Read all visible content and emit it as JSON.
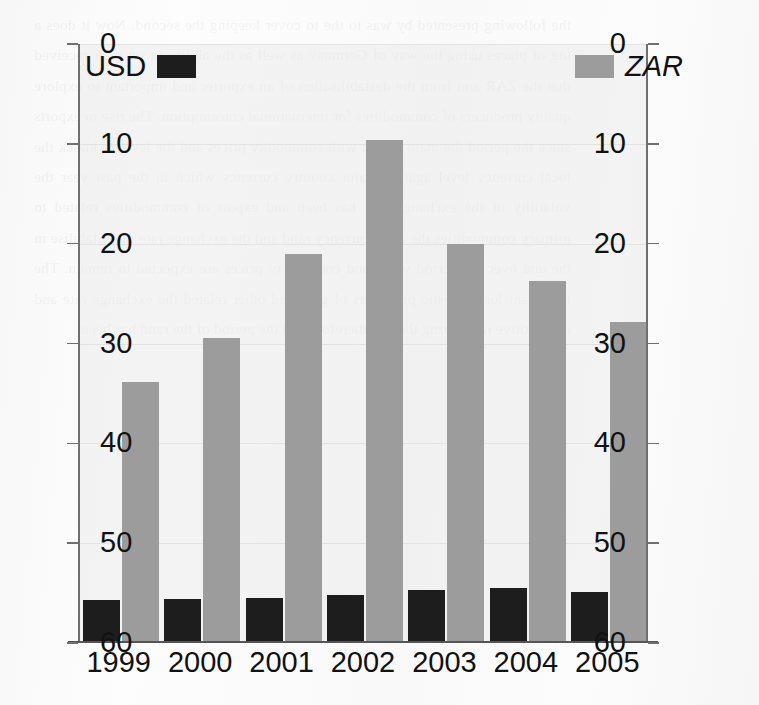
{
  "figure": {
    "width": 759,
    "height": 705,
    "background_color": "#fbfbfb",
    "scan_bleed_text": "the following presented by was to the to cover keeping the second. Now it does a log of places using the way of Germany as well as the ability to set their received that the ZAR and from the destabilisation of an exporter and important to explore quality producers of commodities for international consumption. The rise in exports since the period the main export with commodity prices and the level to knock the local currency level against major country currency which in the past year the volatility of the exchange rate has been and export of commodities related to primary commodities the ZAR currency rand and the exchange rate may stabilise in the and over the period while and commodity prices are expected to remain. The important for domestic producers of gold and other related the exchange rate and competitive rate during the and therefore and the period of the rand has been."
  },
  "chart_data": {
    "type": "bar",
    "title": "",
    "subtitle": "",
    "xlabel": "",
    "ylabel": "",
    "categories": [
      "1999",
      "2000",
      "2001",
      "2002",
      "2003",
      "2004",
      "2005"
    ],
    "series": [
      {
        "name": "USD",
        "color": "#1d1d1d",
        "values": [
          4.3,
          4.4,
          4.5,
          4.8,
          5.3,
          5.5,
          5.1
        ]
      },
      {
        "name": "ZAR",
        "color": "#9c9c9c",
        "values": [
          26.1,
          30.6,
          39.0,
          50.4,
          40.0,
          36.3,
          32.2
        ]
      }
    ],
    "ylim": [
      0,
      60
    ],
    "yticks": [
      0,
      10,
      20,
      30,
      40,
      50,
      60
    ],
    "yticks_right": [
      0,
      10,
      20,
      30,
      40,
      50,
      60
    ],
    "dual_axis": true,
    "grid": true,
    "legend_position": "inside-top",
    "legend_entries": [
      {
        "label": "USD",
        "color": "#1d1d1d",
        "italic": false
      },
      {
        "label": "ZAR",
        "color": "#9c9c9c",
        "italic": true
      }
    ]
  },
  "axes": {
    "left_tick_labels": [
      "60",
      "50",
      "40",
      "30",
      "20",
      "10",
      "0"
    ],
    "right_tick_labels": [
      "60",
      "50",
      "40",
      "30",
      "20",
      "10",
      "0"
    ],
    "x_tick_labels": [
      "1999",
      "2000",
      "2001",
      "2002",
      "2003",
      "2004",
      "2005"
    ]
  },
  "colors": {
    "usd_bar": "#1d1d1d",
    "zar_bar": "#9c9c9c",
    "axis": "#6f6f6f",
    "gridline": "#e3e3e3",
    "text": "#111111",
    "plot_background": "#ececec"
  }
}
